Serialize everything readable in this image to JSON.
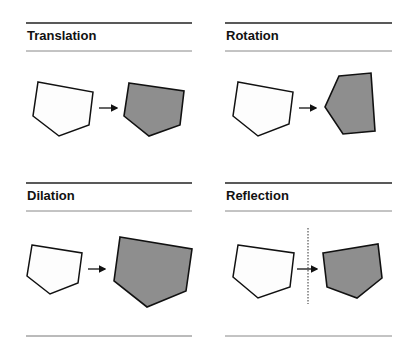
{
  "panels": [
    {
      "title": "Translation",
      "id": "translation"
    },
    {
      "title": "Rotation",
      "id": "rotation"
    },
    {
      "title": "Dilation",
      "id": "dilation"
    },
    {
      "title": "Reflection",
      "id": "reflection"
    }
  ],
  "colors": {
    "preimage_fill": "#fdfdfd",
    "image_fill": "#8e8e8e",
    "stroke": "#111111",
    "rule_thick": "#222222",
    "rule_thin": "#777777"
  }
}
